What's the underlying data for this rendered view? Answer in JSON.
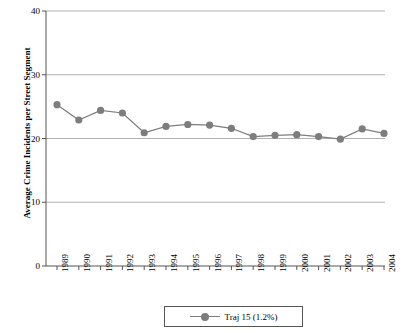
{
  "chart_data": {
    "type": "line",
    "title": "",
    "xlabel": "",
    "ylabel": "Average Crime Incidents per Street Segment",
    "categories": [
      "1989",
      "1990",
      "1991",
      "1992",
      "1993",
      "1994",
      "1995",
      "1996",
      "1997",
      "1998",
      "1999",
      "2000",
      "2001",
      "2002",
      "2003",
      "2004"
    ],
    "series": [
      {
        "name": "Traj 15 (1.2%)",
        "values": [
          25.3,
          22.9,
          24.4,
          24.0,
          20.9,
          21.9,
          22.2,
          22.1,
          21.6,
          20.3,
          20.5,
          20.6,
          20.3,
          19.9,
          21.5,
          20.8
        ]
      }
    ],
    "ylim": [
      0,
      40
    ],
    "yticks": [
      0,
      10,
      20,
      30,
      40
    ],
    "ytick_labels": [
      "0",
      "10",
      "20",
      "30",
      "40"
    ],
    "grid": true,
    "grid_axis": "y",
    "legend_position": "bottom-center",
    "marker": "circle",
    "series_color": "#7d7d7d",
    "grid_color": "#b0b0b0",
    "axis_color": "#555555"
  },
  "legend": {
    "entries": [
      {
        "label": "Traj 15 (1.2%)",
        "icon": "line-marker-icon"
      }
    ]
  },
  "axes": {
    "y_axis_title": "Average Crime Incidents per Street Segment",
    "y_tick_labels": [
      "40",
      "30",
      "20",
      "10",
      "0"
    ],
    "x_tick_labels": [
      "1989",
      "1990",
      "1991",
      "1992",
      "1993",
      "1994",
      "1995",
      "1996",
      "1997",
      "1998",
      "1999",
      "2000",
      "2001",
      "2002",
      "2003",
      "2004"
    ]
  }
}
